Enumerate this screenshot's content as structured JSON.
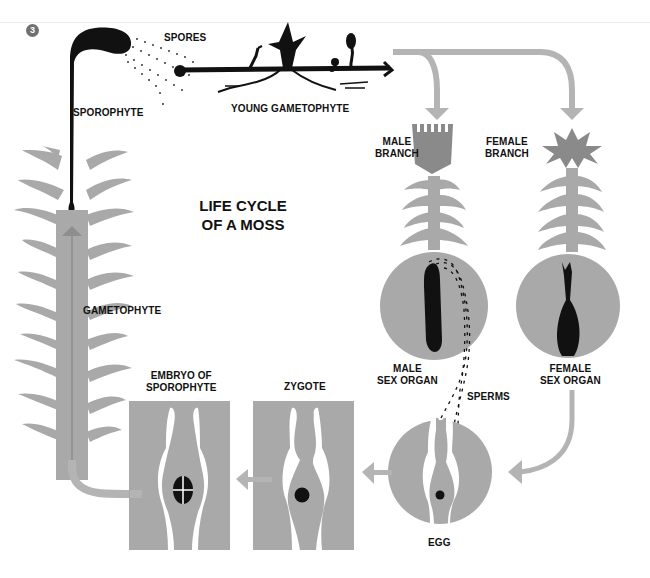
{
  "figure": {
    "number": "3",
    "title_line1": "LIFE CYCLE",
    "title_line2": "OF A MOSS"
  },
  "labels": {
    "spores": "SPORES",
    "sporophyte": "SPOROPHYTE",
    "young_gametophyte": "YOUNG GAMETOPHYTE",
    "male_branch_1": "MALE",
    "male_branch_2": "BRANCH",
    "female_branch_1": "FEMALE",
    "female_branch_2": "BRANCH",
    "gametophyte": "GAMETOPHYTE",
    "male_sex_organ_1": "MALE",
    "male_sex_organ_2": "SEX ORGAN",
    "female_sex_organ_1": "FEMALE",
    "female_sex_organ_2": "SEX ORGAN",
    "sperms": "SPERMS",
    "egg": "EGG",
    "zygote": "ZYGOTE",
    "embryo_1": "EMBRYO OF",
    "embryo_2": "SPOROPHYTE"
  },
  "colors": {
    "plant_gray": "#a9a9a9",
    "dark_gray": "#8a8a8a",
    "arrow_gray": "#b4b4b4",
    "black": "#111111",
    "background": "#ffffff"
  },
  "cycle_stages": [
    "Spores",
    "Young gametophyte",
    "Male branch",
    "Female branch",
    "Male sex organ",
    "Female sex organ",
    "Sperms",
    "Egg",
    "Zygote",
    "Embryo of sporophyte",
    "Gametophyte",
    "Sporophyte"
  ]
}
